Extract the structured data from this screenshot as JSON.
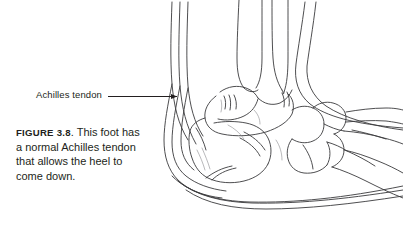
{
  "figure": {
    "number_label": "FIGURE 3.8",
    "caption_text": ". This foot has a normal Achilles tendon that allows the heel to come down.",
    "caption_full": "FIGURE 3.8. This foot has a normal Achilles tendon that allows the heel to come down.",
    "annotation": {
      "label": "Achilles tendon",
      "leader_style": "straight-line-with-arrowhead",
      "points_to": "achilles-tendon-structure"
    },
    "illustration": {
      "type": "line-drawing",
      "subject": "human foot and ankle, lateral (side) view, skeletal bones with soft-tissue outline",
      "view": "lateral-right-facing",
      "line_color": "#3a3a3c",
      "background_color": "#ffffff",
      "structures": [
        "tibia",
        "fibula",
        "achilles-tendon",
        "talus",
        "calcaneus",
        "navicular",
        "cuboid",
        "cuneiforms",
        "metatarsals",
        "heel-soft-tissue-outline",
        "sole-outline"
      ]
    }
  },
  "colors": {
    "text": "#231f20",
    "line": "#3a3a3c",
    "background": "#ffffff"
  }
}
